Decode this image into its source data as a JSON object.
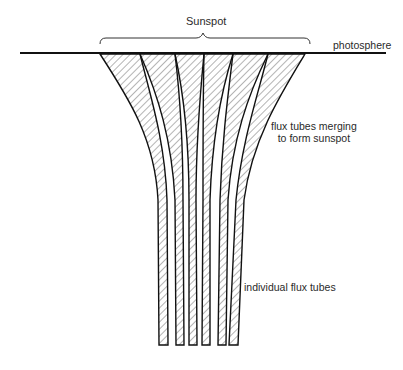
{
  "labels": {
    "sunspot": "Sunspot",
    "photosphere": "photosphere",
    "merging_line1": "flux tubes merging",
    "merging_line2": "to form sunspot",
    "individual": "individual flux tubes"
  },
  "structure": {
    "photosphere_line": {
      "x1": 20,
      "x2": 386,
      "y": 53
    },
    "brace": {
      "x1": 100,
      "x2": 310,
      "y": 40
    },
    "flux_tube_count": 6,
    "hatch_color": "#444444",
    "line_color": "#111111"
  }
}
